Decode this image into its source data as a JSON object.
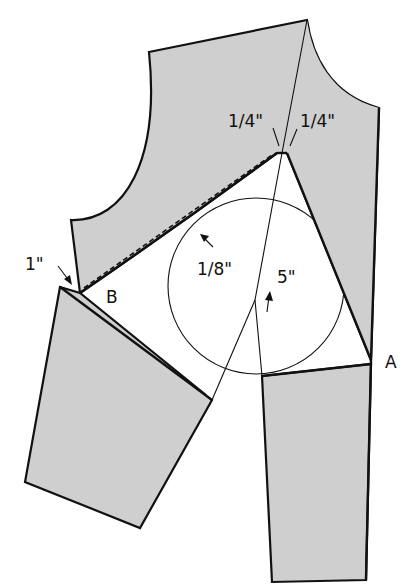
{
  "figure": {
    "colors": {
      "fabric_fill": "#cfcfcf",
      "outline": "#111111",
      "background": "#ffffff"
    }
  },
  "labels": {
    "quarter_left": "1/4\"",
    "quarter_right": "1/4\"",
    "one_inch": "1\"",
    "eighth_inch": "1/8\"",
    "five_inch": "5\"",
    "point_b": "B",
    "point_a": "A"
  }
}
